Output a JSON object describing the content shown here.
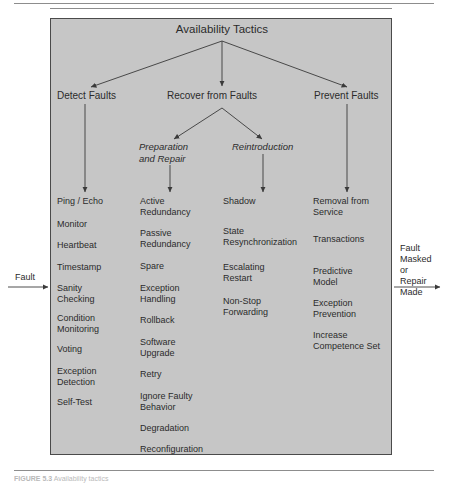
{
  "page": {
    "figure_caption_label": "FIGURE 5.3",
    "figure_caption_text": "Availability tactics"
  },
  "diagram": {
    "title": "Availability Tactics",
    "level2": [
      {
        "id": "detect-faults",
        "label": "Detect Faults"
      },
      {
        "id": "recover-faults",
        "label": "Recover from Faults"
      },
      {
        "id": "prevent-faults",
        "label": "Prevent Faults"
      }
    ],
    "level3": [
      {
        "id": "preparation-and-repair",
        "label": "Preparation\nand Repair"
      },
      {
        "id": "reintroduction",
        "label": "Reintroduction"
      }
    ],
    "columns": [
      {
        "id": "detect-faults-column",
        "parent": "Detect Faults",
        "items": [
          "Ping / Echo",
          "Monitor",
          "Heartbeat",
          "Timestamp",
          "Sanity\nChecking",
          "Condition\nMonitoring",
          "Voting",
          "Exception\nDetection",
          "Self-Test"
        ]
      },
      {
        "id": "preparation-and-repair-column",
        "parent": "Preparation and Repair",
        "items": [
          "Active\nRedundancy",
          "Passive\nRedundancy",
          "Spare",
          "Exception\nHandling",
          "Rollback",
          "Software\nUpgrade",
          "Retry",
          "Ignore Faulty\nBehavior",
          "Degradation",
          "Reconfiguration"
        ]
      },
      {
        "id": "reintroduction-column",
        "parent": "Reintroduction",
        "items": [
          "Shadow",
          "State\nResynchronization",
          "Escalating\nRestart",
          "Non-Stop\nForwarding"
        ]
      },
      {
        "id": "prevent-faults-column",
        "parent": "Prevent Faults",
        "items": [
          "Removal from\nService",
          "Transactions",
          "Predictive\nModel",
          "Exception\nPrevention",
          "Increase\nCompetence Set"
        ]
      }
    ],
    "input_label": "Fault",
    "output_label": "Fault\nMasked\nor\nRepair\nMade"
  },
  "colors": {
    "box_fill": "#c6c6c6",
    "box_border": "#4a4a4a",
    "text": "#2b2b2b",
    "arrow": "#3a3a3a",
    "rule": "#8d8d8d"
  }
}
